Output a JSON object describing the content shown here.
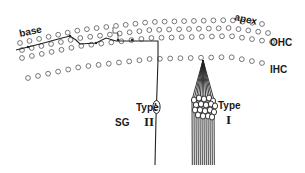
{
  "labels": {
    "base": "base",
    "apex": "apex",
    "ohc": "OHC",
    "ihc": "IHC",
    "sg": "SG",
    "type_word_left": "Type",
    "type_roman_left": "II",
    "type_word_right": "Type",
    "type_roman_right": "I"
  },
  "colors": {
    "ink": "#1a1a1a",
    "cell_stroke": "#555555",
    "background": "#ffffff"
  },
  "hair_cell_rows": [
    {
      "name": "ohc-row-1",
      "points": [
        [
          20,
          43
        ],
        [
          80,
          30
        ],
        [
          150,
          22
        ],
        [
          230,
          20
        ],
        [
          262,
          24
        ]
      ],
      "count": 26,
      "r": 2.4
    },
    {
      "name": "ohc-row-2",
      "points": [
        [
          22,
          50
        ],
        [
          80,
          38
        ],
        [
          150,
          30
        ],
        [
          230,
          28
        ],
        [
          268,
          33
        ]
      ],
      "count": 26,
      "r": 2.4
    },
    {
      "name": "ohc-row-3",
      "points": [
        [
          22,
          58
        ],
        [
          80,
          46
        ],
        [
          150,
          38
        ],
        [
          230,
          36
        ],
        [
          272,
          42
        ]
      ],
      "count": 26,
      "r": 2.4
    },
    {
      "name": "ihc-row",
      "points": [
        [
          28,
          78
        ],
        [
          80,
          67
        ],
        [
          150,
          59
        ],
        [
          230,
          57
        ],
        [
          262,
          63
        ]
      ],
      "count": 24,
      "r": 2.4
    }
  ],
  "diagram_elements": {
    "type_ii_fiber": "spiral fiber from base running to type II ganglion",
    "type_i_fibers": "radial fibers converging on single IHC",
    "spiral_ganglion": "SG cell bodies"
  }
}
